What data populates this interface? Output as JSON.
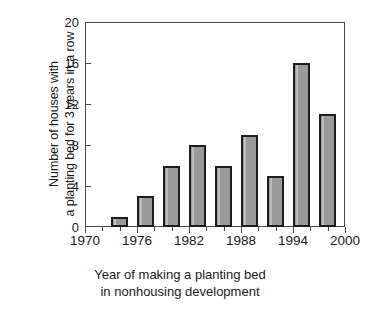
{
  "chart_data": {
    "type": "bar",
    "title": "",
    "xlabel": "Year of making a planting bed in nonhousing development",
    "xlabel_line1": "Year of making a planting bed",
    "xlabel_line2": "in nonhousing development",
    "ylabel": "Number of houses with a planting bed for 3 years in a row",
    "ylabel_line1": "Number of houses with",
    "ylabel_line2": "a planting bed for 3 years in a row",
    "x": [
      1974,
      1977,
      1980,
      1983,
      1986,
      1989,
      1992,
      1995,
      1998
    ],
    "values": [
      1,
      3,
      6,
      8,
      6,
      9,
      5,
      16,
      11
    ],
    "xlim": [
      1970,
      2000
    ],
    "ylim": [
      0,
      20
    ],
    "ytick_labels": [
      "0",
      "4",
      "8",
      "12",
      "16",
      "20"
    ],
    "ytick_values": [
      0,
      4,
      8,
      12,
      16,
      20
    ],
    "xtick_labels": [
      "1970",
      "1976",
      "1982",
      "1988",
      "1994",
      "2000"
    ],
    "xtick_values": [
      1970,
      1976,
      1982,
      1988,
      1994,
      2000
    ],
    "xminor_values": [
      1972,
      1974,
      1978,
      1980,
      1984,
      1986,
      1990,
      1992,
      1996,
      1998
    ],
    "grid": false,
    "legend": false,
    "bar_fill_color": "#9a9a9a",
    "bar_edge_color": "#1d1d1d",
    "axis_color": "#4a4a4a",
    "background_color": "#ffffff"
  }
}
